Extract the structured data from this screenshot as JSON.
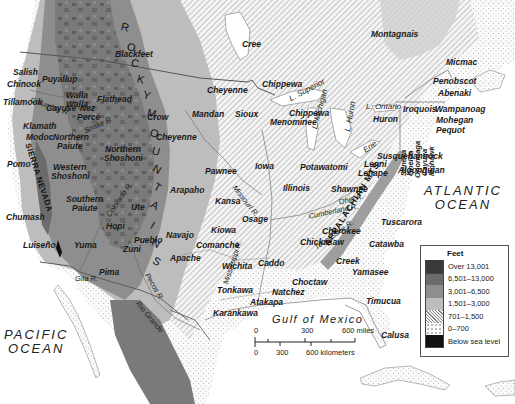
{
  "map": {
    "colors": {
      "over_13001": "#3a3a3a",
      "r6501_13000": "#6b6b6b",
      "r3001_6500": "#8e8e8e",
      "r1501_3000": "#bdbdbd",
      "r701_1500": "#e4e4e4",
      "r0_700": "#f6f6f6",
      "below_sea": "#111111",
      "water": "#ffffff",
      "border": "#6a6a6a"
    },
    "oceans": [
      {
        "id": "pacific",
        "line1": "PACIFIC",
        "line2": "OCEAN",
        "x": 4,
        "y": 328
      },
      {
        "id": "atlantic",
        "line1": "ATLANTIC",
        "line2": "OCEAN",
        "x": 424,
        "y": 184
      }
    ],
    "gulf": {
      "label": "Gulf of Mexico",
      "x": 272,
      "y": 315
    },
    "mountains": {
      "rocky_letters": [
        "R",
        "O",
        "C",
        "K",
        "Y",
        "M",
        "O",
        "U",
        "N",
        "T",
        "A",
        "I",
        "N",
        "S"
      ],
      "appalachian": "APPALACHIAN MTS.",
      "sierra_nevada": "SIERRA NEVADA"
    },
    "lakes": [
      {
        "label": "L. Superior",
        "x": 288,
        "y": 96,
        "rot": -28
      },
      {
        "label": "L. Michigan",
        "x": 311,
        "y": 128,
        "rot": -75
      },
      {
        "label": "L. Huron",
        "x": 344,
        "y": 131,
        "rot": -80
      },
      {
        "label": "L. Ontario",
        "x": 366,
        "y": 103,
        "rot": 0
      },
      {
        "label": "Erie",
        "x": 362,
        "y": 148,
        "rot": -35
      }
    ],
    "rivers": [
      {
        "label": "Columbia R.",
        "x": 32,
        "y": 96,
        "rot": 20
      },
      {
        "label": "Snake R.",
        "x": 83,
        "y": 128,
        "rot": -25
      },
      {
        "label": "Colorado R.",
        "x": 105,
        "y": 214,
        "rot": -55
      },
      {
        "label": "Gila R.",
        "x": 75,
        "y": 275,
        "rot": 0
      },
      {
        "label": "Pecos R.",
        "x": 150,
        "y": 272,
        "rot": 60
      },
      {
        "label": "Rio Grande",
        "x": 140,
        "y": 300,
        "rot": 50
      },
      {
        "label": "Missouri R.",
        "x": 237,
        "y": 184,
        "rot": 52
      },
      {
        "label": "Mississippi R.",
        "x": 222,
        "y": 283,
        "rot": -72
      },
      {
        "label": "Ohio R.",
        "x": 338,
        "y": 199,
        "rot": -15
      },
      {
        "label": "Cumberland R.",
        "x": 308,
        "y": 213,
        "rot": -12
      },
      {
        "label": "Tennessee R.",
        "x": 313,
        "y": 245,
        "rot": -35
      }
    ],
    "tribes": [
      {
        "label": "Blackfeet",
        "x": 115,
        "y": 50
      },
      {
        "label": "Cree",
        "x": 242,
        "y": 40
      },
      {
        "label": "Montagnais",
        "x": 371,
        "y": 30
      },
      {
        "label": "Micmac",
        "x": 446,
        "y": 58
      },
      {
        "label": "Penobscot",
        "x": 433,
        "y": 77
      },
      {
        "label": "Abenaki",
        "x": 438,
        "y": 89
      },
      {
        "label": "Salish",
        "x": 13,
        "y": 68
      },
      {
        "label": "Chinook",
        "x": 7,
        "y": 80
      },
      {
        "label": "Puyallup",
        "x": 42,
        "y": 75
      },
      {
        "label": "Tillamook",
        "x": 3,
        "y": 98
      },
      {
        "label": "Walla",
        "x": 66,
        "y": 91
      },
      {
        "label": "Walla",
        "x": 66,
        "y": 100
      },
      {
        "label": "Cayuse",
        "x": 46,
        "y": 104
      },
      {
        "label": "Nez",
        "x": 80,
        "y": 104
      },
      {
        "label": "Percé",
        "x": 77,
        "y": 113
      },
      {
        "label": "Flathead",
        "x": 97,
        "y": 95
      },
      {
        "label": "Crow",
        "x": 147,
        "y": 113
      },
      {
        "label": "Chippewa",
        "x": 262,
        "y": 80
      },
      {
        "label": "Cheyenne",
        "x": 207,
        "y": 86
      },
      {
        "label": "Mandan",
        "x": 192,
        "y": 110
      },
      {
        "label": "Sioux",
        "x": 235,
        "y": 110
      },
      {
        "label": "Chippewa",
        "x": 289,
        "y": 109
      },
      {
        "label": "Menominee",
        "x": 270,
        "y": 118
      },
      {
        "label": "Iroquois",
        "x": 403,
        "y": 105
      },
      {
        "label": "Huron",
        "x": 373,
        "y": 115
      },
      {
        "label": "Wampanoag",
        "x": 435,
        "y": 105
      },
      {
        "label": "Mohegan",
        "x": 436,
        "y": 116
      },
      {
        "label": "Pequot",
        "x": 436,
        "y": 126
      },
      {
        "label": "Klamath",
        "x": 23,
        "y": 122
      },
      {
        "label": "Modoc",
        "x": 26,
        "y": 133
      },
      {
        "label": "Northern",
        "x": 53,
        "y": 133
      },
      {
        "label": "Paiute",
        "x": 57,
        "y": 142
      },
      {
        "label": "Northern",
        "x": 105,
        "y": 145
      },
      {
        "label": "Shoshoni",
        "x": 104,
        "y": 154
      },
      {
        "label": "Cheyenne",
        "x": 156,
        "y": 133
      },
      {
        "label": "Pomo",
        "x": 7,
        "y": 160
      },
      {
        "label": "Western",
        "x": 53,
        "y": 163
      },
      {
        "label": "Shoshoni",
        "x": 51,
        "y": 172
      },
      {
        "label": "Iowa",
        "x": 255,
        "y": 162
      },
      {
        "label": "Potawatomi",
        "x": 300,
        "y": 163
      },
      {
        "label": "Lenni",
        "x": 364,
        "y": 160
      },
      {
        "label": "Lenape",
        "x": 358,
        "y": 169
      },
      {
        "label": "Susquehannock",
        "x": 377,
        "y": 152
      },
      {
        "label": "Algonquian",
        "x": 398,
        "y": 166
      },
      {
        "label": "Pawnee",
        "x": 205,
        "y": 167
      },
      {
        "label": "Arapaho",
        "x": 170,
        "y": 186
      },
      {
        "label": "Illinois",
        "x": 283,
        "y": 184
      },
      {
        "label": "Shawnee",
        "x": 331,
        "y": 185
      },
      {
        "label": "Southern",
        "x": 66,
        "y": 195
      },
      {
        "label": "Paiute",
        "x": 72,
        "y": 204
      },
      {
        "label": "Ute",
        "x": 131,
        "y": 203
      },
      {
        "label": "Kansa",
        "x": 215,
        "y": 197
      },
      {
        "label": "Osage",
        "x": 242,
        "y": 215
      },
      {
        "label": "Chumash",
        "x": 6,
        "y": 213
      },
      {
        "label": "Hopi",
        "x": 106,
        "y": 222
      },
      {
        "label": "Kiowa",
        "x": 211,
        "y": 226
      },
      {
        "label": "Cherokee",
        "x": 322,
        "y": 227
      },
      {
        "label": "Tuscarora",
        "x": 381,
        "y": 218
      },
      {
        "label": "Navajo",
        "x": 166,
        "y": 231
      },
      {
        "label": "Pueblo",
        "x": 134,
        "y": 236
      },
      {
        "label": "Comanche",
        "x": 196,
        "y": 241
      },
      {
        "label": "Chickasaw",
        "x": 300,
        "y": 238
      },
      {
        "label": "Catawba",
        "x": 369,
        "y": 240
      },
      {
        "label": "Luiseño",
        "x": 23,
        "y": 241
      },
      {
        "label": "Yuma",
        "x": 74,
        "y": 241
      },
      {
        "label": "Zuni",
        "x": 123,
        "y": 245
      },
      {
        "label": "Apache",
        "x": 170,
        "y": 254
      },
      {
        "label": "Creek",
        "x": 336,
        "y": 257
      },
      {
        "label": "Caddo",
        "x": 258,
        "y": 259
      },
      {
        "label": "Wichita",
        "x": 222,
        "y": 262
      },
      {
        "label": "Yamasee",
        "x": 352,
        "y": 268
      },
      {
        "label": "Pima",
        "x": 99,
        "y": 268
      },
      {
        "label": "Choctaw",
        "x": 292,
        "y": 278
      },
      {
        "label": "Natchez",
        "x": 272,
        "y": 288
      },
      {
        "label": "Tonkawa",
        "x": 217,
        "y": 286
      },
      {
        "label": "Atakapa",
        "x": 250,
        "y": 298
      },
      {
        "label": "Timucua",
        "x": 366,
        "y": 297
      },
      {
        "label": "Karankawa",
        "x": 213,
        "y": 309
      },
      {
        "label": "Calusa",
        "x": 381,
        "y": 331
      }
    ],
    "iroquois_nations": [
      {
        "label": "Seneca",
        "x": 399,
        "y": 146
      },
      {
        "label": "Oneida",
        "x": 406,
        "y": 146
      },
      {
        "label": "Onondaga",
        "x": 413,
        "y": 148
      },
      {
        "label": "Cayuga",
        "x": 420,
        "y": 146
      },
      {
        "label": "Mohawk",
        "x": 427,
        "y": 146
      }
    ]
  },
  "legend": {
    "title": "Feet",
    "items": [
      {
        "label": "Over 13,001",
        "color": "#3a3a3a",
        "pattern": "solid"
      },
      {
        "label": "6,501–13,000",
        "color": "#6b6b6b",
        "pattern": "solid"
      },
      {
        "label": "3,001–6,500",
        "color": "#8e8e8e",
        "pattern": "solid"
      },
      {
        "label": "1,501–3,000",
        "color": "#bdbdbd",
        "pattern": "solid"
      },
      {
        "label": "701–1,500",
        "color": "#ffffff",
        "pattern": "hatch"
      },
      {
        "label": "0–700",
        "color": "#ffffff",
        "pattern": "dots"
      },
      {
        "label": "Below sea level",
        "color": "#111111",
        "pattern": "solid"
      }
    ]
  },
  "scale": {
    "miles": {
      "ticks": [
        "0",
        "300",
        "600 miles"
      ]
    },
    "kilometers": {
      "ticks": [
        "0",
        "300",
        "600 kilometers"
      ]
    }
  }
}
